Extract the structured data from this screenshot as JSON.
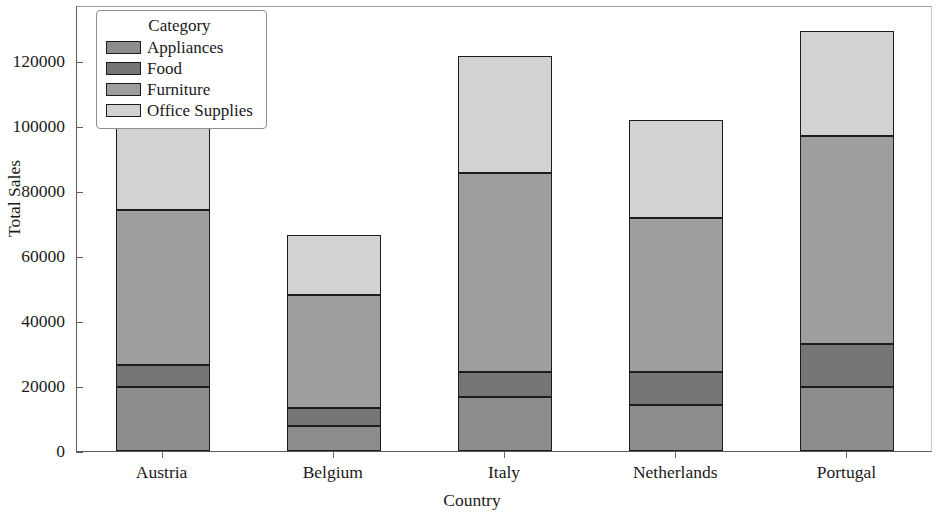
{
  "chart_data": {
    "type": "bar",
    "stacked": true,
    "title": "",
    "xlabel": "Country",
    "ylabel": "Total Sales",
    "categories": [
      "Austria",
      "Belgium",
      "Italy",
      "Netherlands",
      "Portugal"
    ],
    "series": [
      {
        "name": "Appliances",
        "color": "#8c8c8c",
        "values": [
          19600,
          7600,
          16600,
          14200,
          19700
        ]
      },
      {
        "name": "Food",
        "color": "#757575",
        "values": [
          7000,
          5500,
          7600,
          10200,
          13200
        ]
      },
      {
        "name": "Furniture",
        "color": "#9e9e9e",
        "values": [
          47700,
          34800,
          61300,
          47400,
          64000
        ]
      },
      {
        "name": "Office Supplies",
        "color": "#d2d2d2",
        "values": [
          27000,
          18600,
          36000,
          29900,
          32300
        ]
      }
    ],
    "totals": [
      101300,
      66500,
      121500,
      101700,
      129200
    ],
    "ylim": [
      0,
      133000
    ],
    "yticks": [
      0,
      20000,
      40000,
      60000,
      80000,
      100000,
      120000
    ],
    "ytick_labels": [
      "0",
      "20000",
      "40000",
      "60000",
      "80000",
      "100000",
      "120000"
    ],
    "grid": false,
    "legend": {
      "title": "Category",
      "position": "upper-left-inside",
      "entries": [
        "Appliances",
        "Food",
        "Furniture",
        "Office Supplies"
      ]
    }
  }
}
